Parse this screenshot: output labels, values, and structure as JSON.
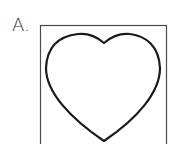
{
  "option": {
    "label": "A.",
    "shape": "heart-outline",
    "frame": "square-box"
  },
  "colors": {
    "stroke": "#1a1a1a",
    "frame": "#4a4a4a",
    "background": "#ffffff"
  }
}
